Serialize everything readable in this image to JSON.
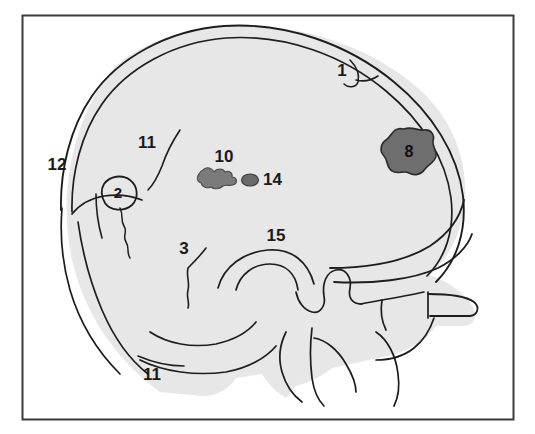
{
  "figure": {
    "frame": {
      "border_color": "#3a3a3a",
      "background_color": "#ffffff"
    },
    "skull": {
      "fill_color": "#e7e7e7",
      "outline_color": "#1d1d1d"
    },
    "lesions": {
      "large_blob_color": "#6e6e6e",
      "small_blob_color": "#7b7b7b",
      "dot_color": "#6a6a6a",
      "lesion_outline_color": "#2a2a2a"
    }
  },
  "labels": [
    {
      "id": "label-1",
      "text": "1",
      "x": 342,
      "y": 72,
      "anchor": "middle",
      "role": "coronal-suture-marker"
    },
    {
      "id": "label-12",
      "text": "12",
      "x": 57,
      "y": 166,
      "anchor": "middle",
      "role": "frontal-margin-marker"
    },
    {
      "id": "label-11-upper",
      "text": "11",
      "x": 147,
      "y": 144,
      "anchor": "middle",
      "role": "vascular-groove-marker"
    },
    {
      "id": "label-2",
      "text": "2",
      "x": 116,
      "y": 193,
      "anchor": "middle",
      "role": "lesion-outlined-marker"
    },
    {
      "id": "label-10",
      "text": "10",
      "x": 224,
      "y": 158,
      "anchor": "middle",
      "role": "irregular-lesion-marker"
    },
    {
      "id": "label-14",
      "text": "14",
      "x": 265,
      "y": 181,
      "anchor": "start",
      "role": "small-dot-lesion-marker"
    },
    {
      "id": "label-8",
      "text": "8",
      "x": 404,
      "y": 154,
      "anchor": "middle",
      "role": "large-lesion-marker"
    },
    {
      "id": "label-3",
      "text": "3",
      "x": 184,
      "y": 250,
      "anchor": "middle",
      "role": "suture-marker"
    },
    {
      "id": "label-15",
      "text": "15",
      "x": 276,
      "y": 237,
      "anchor": "middle",
      "role": "sella-region-marker"
    },
    {
      "id": "label-11-lower",
      "text": "11",
      "x": 152,
      "y": 376,
      "anchor": "middle",
      "role": "vascular-groove-marker-lower"
    }
  ]
}
